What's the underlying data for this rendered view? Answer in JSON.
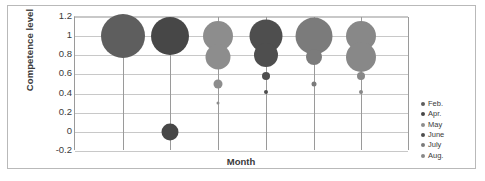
{
  "chart_data": {
    "type": "scatter",
    "subtype": "bubble",
    "title": "",
    "xlabel": "Month",
    "ylabel": "Competence level",
    "ylim": [
      -0.2,
      1.2
    ],
    "yticks": [
      "1.2",
      "1",
      "0.8",
      "0.6",
      "0.4",
      "0.2",
      "0",
      "-0.2"
    ],
    "ytick_values": [
      1.2,
      1,
      0.8,
      0.6,
      0.4,
      0.2,
      0,
      -0.2
    ],
    "xticks": [],
    "xlim": [
      0,
      7
    ],
    "grid": "horizontal-and-vertical",
    "legend_position": "right-inside-bottom",
    "categories": [
      "Feb.",
      "Apr.",
      "May",
      "June",
      "July",
      "Aug."
    ],
    "series": [
      {
        "name": "Feb.",
        "color": "#5e5e5e",
        "x": 1,
        "points": [
          {
            "y": 1,
            "size": 44
          }
        ]
      },
      {
        "name": "Apr.",
        "color": "#474747",
        "x": 2,
        "points": [
          {
            "y": 1,
            "size": 38
          },
          {
            "y": 0,
            "size": 17
          }
        ]
      },
      {
        "name": "May",
        "color": "#8d8d8d",
        "x": 3,
        "points": [
          {
            "y": 1,
            "size": 30
          },
          {
            "y": 0.78,
            "size": 25
          },
          {
            "y": 0.5,
            "size": 9
          },
          {
            "y": 0.3,
            "size": 3
          }
        ]
      },
      {
        "name": "June",
        "color": "#4e4e4e",
        "x": 4,
        "points": [
          {
            "y": 1,
            "size": 33
          },
          {
            "y": 0.8,
            "size": 24
          },
          {
            "y": 0.58,
            "size": 8
          },
          {
            "y": 0.42,
            "size": 4
          }
        ]
      },
      {
        "name": "July",
        "color": "#7b7b7b",
        "x": 5,
        "points": [
          {
            "y": 1,
            "size": 37
          },
          {
            "y": 0.78,
            "size": 16
          },
          {
            "y": 0.5,
            "size": 5
          }
        ]
      },
      {
        "name": "Aug.",
        "color": "#888888",
        "x": 6,
        "points": [
          {
            "y": 1,
            "size": 30
          },
          {
            "y": 0.78,
            "size": 30
          },
          {
            "y": 0.58,
            "size": 8
          },
          {
            "y": 0.42,
            "size": 4
          }
        ]
      }
    ]
  },
  "legend": {
    "items": [
      {
        "label": "Feb.",
        "color": "#5e5e5e"
      },
      {
        "label": "Apr.",
        "color": "#474747"
      },
      {
        "label": "May",
        "color": "#8d8d8d"
      },
      {
        "label": "June",
        "color": "#4e4e4e"
      },
      {
        "label": "July",
        "color": "#7b7b7b"
      },
      {
        "label": "Aug.",
        "color": "#888888"
      }
    ]
  },
  "colors": {
    "grid_horizontal": "#c8c8c8",
    "grid_vertical": "#9a9a9a",
    "frame": "#b9b9b9",
    "text": "#3a3a3a",
    "background": "#ffffff"
  }
}
